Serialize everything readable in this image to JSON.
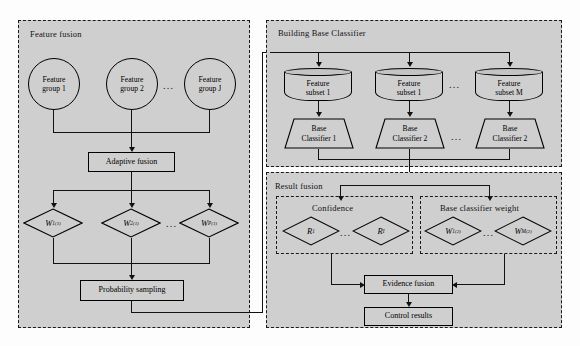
{
  "diagram": {
    "title": "",
    "background_color": "#fdfdfd",
    "panel_fill": "#cfcfcf",
    "line_color": "#111111"
  },
  "feature_fusion": {
    "title": "Feature fusion",
    "groups": [
      {
        "line1": "Feature",
        "line2": "group 1"
      },
      {
        "line1": "Feature",
        "line2": "group 2"
      },
      {
        "line1": "Feature",
        "line2": "group J"
      }
    ],
    "groups_ellipsis": "...",
    "adaptive_fusion": "Adaptive fusion",
    "weights": [
      {
        "base": "W",
        "sub": "1",
        "sup": "(1)"
      },
      {
        "base": "W",
        "sub": "2",
        "sup": "(1)"
      },
      {
        "base": "W",
        "sub": "P",
        "sup": "(1)"
      }
    ],
    "weights_ellipsis": "...",
    "probability_sampling": "Probability sampling"
  },
  "building_base_classifier": {
    "title": "Building Base Classifier",
    "subsets": [
      {
        "line1": "Feature",
        "line2": "subset 1"
      },
      {
        "line1": "Feature",
        "line2": "subset 1"
      },
      {
        "line1": "Feature",
        "line2": "subset M"
      }
    ],
    "subsets_ellipsis": "...",
    "classifiers": [
      {
        "line1": "Base",
        "line2": "Classifier 1"
      },
      {
        "line1": "Base",
        "line2": "Classifier 2"
      },
      {
        "line1": "Base",
        "line2": "Classifier 2"
      }
    ],
    "classifiers_ellipsis": "..."
  },
  "result_fusion": {
    "title": "Result fusion",
    "confidence": {
      "title": "Confidence",
      "items": [
        {
          "base": "R",
          "sub": "1",
          "sup": ""
        },
        {
          "base": "R",
          "sub": "I",
          "sup": ""
        }
      ],
      "ellipsis": "..."
    },
    "base_classifier_weight": {
      "title": "Base classifier weight",
      "items": [
        {
          "base": "W",
          "sub": "1",
          "sup": "(2)"
        },
        {
          "base": "W",
          "sub": "M",
          "sup": "(2)"
        }
      ],
      "ellipsis": "..."
    },
    "evidence_fusion": "Evidence fusion",
    "control_results": "Control results"
  }
}
